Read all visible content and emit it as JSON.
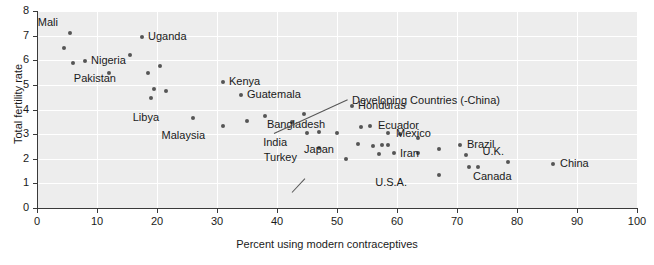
{
  "chart_data": {
    "type": "scatter",
    "title": "",
    "xlabel": "Percent using modern contraceptives",
    "ylabel": "Total fertility rate",
    "xlim": [
      0,
      100
    ],
    "ylim": [
      0,
      8
    ],
    "xticks": [
      "0",
      "10",
      "20",
      "30",
      "40",
      "50",
      "60",
      "70",
      "80",
      "90",
      "100"
    ],
    "yticks": [
      "0",
      "1",
      "2",
      "3",
      "4",
      "5",
      "6",
      "7",
      "8"
    ],
    "grid": true,
    "legend": "none",
    "marker_color": "#555555",
    "plot_background": "#ededed",
    "grid_color": "#ffffff",
    "points": [
      {
        "x": 4.5,
        "y": 6.5,
        "label": ""
      },
      {
        "x": 5.5,
        "y": 7.1,
        "label": "Mali",
        "lx": -12,
        "ly": -16
      },
      {
        "x": 6.0,
        "y": 5.9,
        "label": ""
      },
      {
        "x": 8.0,
        "y": 5.95,
        "label": "Nigeria",
        "lx": 6,
        "ly": -6
      },
      {
        "x": 12.0,
        "y": 5.5,
        "label": ""
      },
      {
        "x": 17.5,
        "y": 6.95,
        "label": "Uganda",
        "lx": 6,
        "ly": -6
      },
      {
        "x": 15.5,
        "y": 6.2,
        "label": ""
      },
      {
        "x": 18.5,
        "y": 5.5,
        "label": ""
      },
      {
        "x": 20.5,
        "y": 5.75,
        "label": ""
      },
      {
        "x": 19.5,
        "y": 4.85,
        "label": "Pakistan",
        "lx": -38,
        "ly": -16
      },
      {
        "x": 21.5,
        "y": 4.75,
        "label": ""
      },
      {
        "x": 19.0,
        "y": 4.45,
        "label": ""
      },
      {
        "x": 31.0,
        "y": 5.1,
        "label": "Kenya",
        "lx": 6,
        "ly": -6
      },
      {
        "x": 34.0,
        "y": 4.6,
        "label": "Guatemala",
        "lx": 6,
        "ly": -6
      },
      {
        "x": 26.0,
        "y": 3.65,
        "label": "Libya",
        "lx": -34,
        "ly": -6
      },
      {
        "x": 31.0,
        "y": 3.35,
        "label": "Malaysia",
        "lx": -18,
        "ly": 4
      },
      {
        "x": 35.0,
        "y": 3.55,
        "label": ""
      },
      {
        "x": 38.0,
        "y": 3.75,
        "label": ""
      },
      {
        "x": 42.5,
        "y": 3.5,
        "label": ""
      },
      {
        "x": 44.5,
        "y": 3.8,
        "label": ""
      },
      {
        "x": 45.0,
        "y": 3.05,
        "label": "India",
        "lx": -20,
        "ly": 4
      },
      {
        "x": 47.0,
        "y": 3.1,
        "label": ""
      },
      {
        "x": 47.0,
        "y": 2.45,
        "label": "Turkey",
        "lx": -22,
        "ly": 4
      },
      {
        "x": 50.0,
        "y": 3.05,
        "label": "Bangladesh",
        "lx": -12,
        "ly": -14
      },
      {
        "x": 52.5,
        "y": 4.15,
        "label": "Honduras",
        "lx": 6,
        "ly": -6
      },
      {
        "x": 54.0,
        "y": 3.3,
        "label": ""
      },
      {
        "x": 55.5,
        "y": 3.35,
        "label": "Ecuador",
        "lx": 8,
        "ly": -6
      },
      {
        "x": 51.5,
        "y": 2.0,
        "label": "Japan",
        "lx": -12,
        "ly": -15
      },
      {
        "x": 53.5,
        "y": 2.6,
        "label": ""
      },
      {
        "x": 56.0,
        "y": 2.5,
        "label": ""
      },
      {
        "x": 57.5,
        "y": 2.55,
        "label": ""
      },
      {
        "x": 58.5,
        "y": 2.55,
        "label": ""
      },
      {
        "x": 57.0,
        "y": 2.2,
        "label": ""
      },
      {
        "x": 59.5,
        "y": 2.25,
        "label": "Iran",
        "lx": 6,
        "ly": -5
      },
      {
        "x": 58.5,
        "y": 3.05,
        "label": "Mexico",
        "lx": 8,
        "ly": -5
      },
      {
        "x": 60.5,
        "y": 3.0,
        "label": ""
      },
      {
        "x": 63.5,
        "y": 2.85,
        "label": ""
      },
      {
        "x": 63.5,
        "y": 2.25,
        "label": ""
      },
      {
        "x": 67.0,
        "y": 2.4,
        "label": ""
      },
      {
        "x": 67.0,
        "y": 1.35,
        "label": "U.S.A.",
        "lx": -32,
        "ly": 2
      },
      {
        "x": 70.5,
        "y": 2.55,
        "label": "Brazil",
        "lx": 7,
        "ly": -6
      },
      {
        "x": 71.5,
        "y": 2.15,
        "label": ""
      },
      {
        "x": 72.0,
        "y": 1.65,
        "label": "Canada",
        "lx": 4,
        "ly": 4
      },
      {
        "x": 73.5,
        "y": 1.65,
        "label": ""
      },
      {
        "x": 78.5,
        "y": 1.85,
        "label": "U.K.",
        "lx": -4,
        "ly": -16
      },
      {
        "x": 86.0,
        "y": 1.8,
        "label": "China",
        "lx": 7,
        "ly": -6
      }
    ],
    "annotations": [
      {
        "text": "Developing Countries (-China)",
        "tx": 352,
        "ty": 95,
        "leader": {
          "x1": 274,
          "y1": 133,
          "x2": 348,
          "y2": 99
        }
      }
    ],
    "japan_leader": {
      "x1": 292,
      "y1": 192,
      "x2": 305,
      "y2": 178
    }
  }
}
